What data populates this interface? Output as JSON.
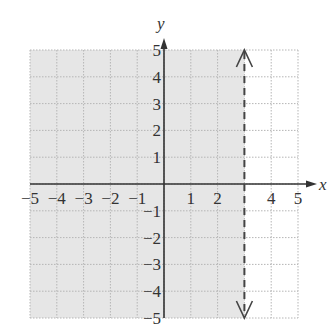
{
  "chart_data": {
    "type": "inequality-graph",
    "title": "",
    "xlabel": "x",
    "ylabel": "y",
    "xlim": [
      -5,
      5
    ],
    "ylim": [
      -5,
      5
    ],
    "grid": true,
    "x_tick_labels": [
      "−5",
      "−4",
      "−3",
      "−2",
      "−1",
      "1",
      "2",
      "4",
      "5"
    ],
    "x_tick_values": [
      -5,
      -4,
      -3,
      -2,
      -1,
      1,
      2,
      4,
      5
    ],
    "y_tick_labels": [
      "5",
      "4",
      "3",
      "2",
      "1",
      "−1",
      "−2",
      "−3",
      "−4",
      "−5"
    ],
    "y_tick_values": [
      5,
      4,
      3,
      2,
      1,
      -1,
      -2,
      -3,
      -4,
      -5
    ],
    "boundary": {
      "equation": "x = 3",
      "style": "dashed",
      "arrows": "both-ends"
    },
    "shaded_region": "x < 3",
    "inequality": "x < 3",
    "colors": {
      "shade": "#e6e6e6",
      "grid": "#b5b5b5",
      "axis": "#333333",
      "boundary": "#444444"
    }
  }
}
